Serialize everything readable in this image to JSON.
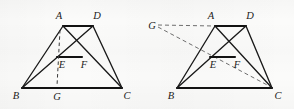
{
  "document": {
    "type": "geometry-diagram",
    "description": "Two trapezoid figures with cevians and labeled points",
    "background_color": "#fbfbfa",
    "ink_color": "#1a1a1a"
  },
  "figures": [
    {
      "id": "left-figure",
      "name": "trapezoid-figure-left",
      "labels": {
        "A": "A",
        "B": "B",
        "C": "C",
        "D": "D",
        "E": "E",
        "F": "F",
        "G": "G"
      },
      "points": {
        "A": [
          63,
          26
        ],
        "D": [
          93,
          26
        ],
        "B": [
          22,
          88
        ],
        "C": [
          122,
          88
        ],
        "E": [
          57,
          57
        ],
        "F": [
          82,
          57
        ],
        "G": [
          57,
          88
        ]
      },
      "solid_segments": [
        [
          "A",
          "D"
        ],
        [
          "B",
          "C"
        ],
        [
          "A",
          "B"
        ],
        [
          "D",
          "C"
        ],
        [
          "A",
          "C"
        ],
        [
          "D",
          "B"
        ],
        [
          "E",
          "F"
        ]
      ],
      "dashed_segments": [
        [
          "A",
          "G"
        ]
      ]
    },
    {
      "id": "right-figure",
      "name": "trapezoid-figure-right",
      "labels": {
        "A": "A",
        "B": "B",
        "C": "C",
        "D": "D",
        "E": "E",
        "F": "F",
        "G": "G"
      },
      "points": {
        "A": [
          215,
          26
        ],
        "D": [
          246,
          26
        ],
        "B": [
          177,
          88
        ],
        "C": [
          272,
          88
        ],
        "E": [
          210,
          57
        ],
        "F": [
          235,
          57
        ],
        "G": [
          154,
          25
        ]
      },
      "solid_segments": [
        [
          "A",
          "D"
        ],
        [
          "B",
          "C"
        ],
        [
          "A",
          "B"
        ],
        [
          "D",
          "C"
        ],
        [
          "A",
          "C"
        ],
        [
          "D",
          "B"
        ],
        [
          "E",
          "F"
        ]
      ],
      "dashed_segments": [
        [
          "G",
          "A"
        ],
        [
          "G",
          "C"
        ]
      ]
    }
  ]
}
